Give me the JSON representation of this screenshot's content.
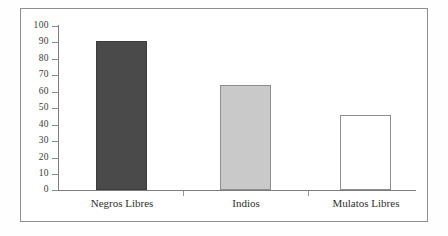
{
  "chart_data": {
    "type": "bar",
    "title": "",
    "subtitle": "",
    "xlabel": "",
    "ylabel": "",
    "categories": [
      "Negros Libres",
      "Indios",
      "Mulatos Libres"
    ],
    "values": [
      91,
      64,
      46
    ],
    "series": [
      {
        "name": "",
        "values": [
          91,
          64,
          46
        ]
      }
    ],
    "ylim": [
      0,
      100
    ],
    "ytick_labels": [
      "100",
      "90",
      "80",
      "70",
      "60",
      "50",
      "40",
      "30",
      "20",
      "10",
      "0"
    ],
    "ytick_values": [
      100,
      90,
      80,
      70,
      60,
      50,
      40,
      30,
      20,
      10,
      0
    ],
    "grid": false,
    "legend": "none",
    "bar_colors": [
      "#4a4a4a",
      "#c9c9c9",
      "#ffffff"
    ],
    "bar_border_colors": [
      "#3c3c3c",
      "#8e8e8e",
      "#8e8e8e"
    ],
    "axis_color": "#7d7d7d",
    "frame_color": "#8d8d8d",
    "background": "#ffffff"
  }
}
